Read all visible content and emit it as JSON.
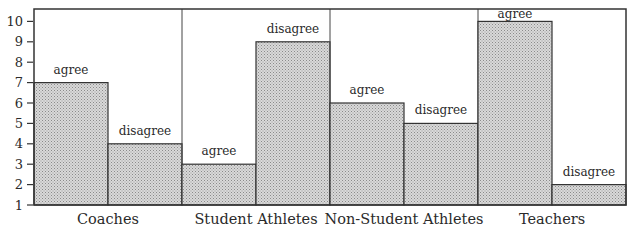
{
  "chart_data": {
    "type": "bar",
    "title": "",
    "xlabel": "",
    "ylabel": "",
    "categories": [
      "Coaches",
      "Student Athletes",
      "Non-Student Athletes",
      "Teachers"
    ],
    "series": [
      {
        "name": "agree",
        "values": [
          7,
          3,
          6,
          10
        ]
      },
      {
        "name": "disagree",
        "values": [
          4,
          9,
          5,
          2
        ]
      }
    ],
    "bar_labels": [
      "agree",
      "disagree"
    ],
    "yticks": [
      1,
      2,
      3,
      4,
      5,
      6,
      7,
      8,
      9,
      10
    ],
    "ylim": [
      1,
      10.6
    ],
    "grid": false,
    "legend": "none (bars labeled directly)",
    "bar_fill": "#c8c8c8",
    "stroke": "#333333"
  }
}
